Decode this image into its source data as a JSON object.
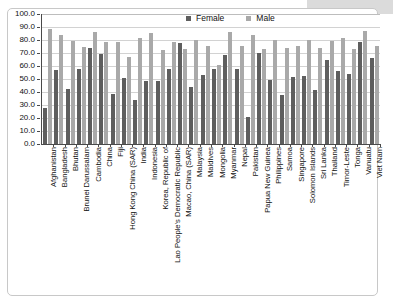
{
  "chart_data": {
    "type": "bar",
    "title": "",
    "xlabel": "",
    "ylabel": "",
    "ylim": [
      0,
      100
    ],
    "ytick_labels": [
      "100.0",
      "90.0",
      "80.0",
      "70.0",
      "60.0",
      "50.0",
      "40.0",
      "30.0",
      "20.0",
      "10.0",
      "0.0"
    ],
    "ytick_values": [
      100,
      90,
      80,
      70,
      60,
      50,
      40,
      30,
      20,
      10,
      0
    ],
    "grid": true,
    "legend_position": "top-center",
    "categories": [
      "Afghanistan",
      "Bangladesh",
      "Bhutan",
      "Brunei Darussalam",
      "Cambodia",
      "China",
      "Fiji",
      "Hong Kong China (SAR)",
      "India",
      "Indonesia",
      "Korea, Republic of",
      "Lao People's Democratic Republic",
      "Macao, China (SAR)",
      "Malaysia",
      "Maldives",
      "Mongolia",
      "Myanmar",
      "Nepal",
      "Pakistan",
      "Papua New Guinea",
      "Philippines",
      "Samoa",
      "Singapore",
      "Solomon Islands",
      "Sri Lanka",
      "Thailand",
      "Timor-Leste",
      "Tonga",
      "Vanuatu",
      "Viet Nam"
    ],
    "series": [
      {
        "name": "Female",
        "color": "#5e5e5e",
        "values": [
          28.0,
          56.8,
          42.7,
          57.5,
          74.0,
          69.2,
          38.7,
          50.5,
          33.6,
          48.6,
          48.6,
          58.0,
          77.7,
          43.6,
          53.4,
          57.5,
          68.2,
          58.0,
          20.5,
          70.0,
          49.0,
          38.0,
          51.7,
          52.7,
          41.3,
          64.5,
          56.2,
          53.6,
          78.3,
          65.8
        ]
      },
      {
        "name": "Male",
        "color": "#a9a9a9",
        "values": [
          88.3,
          83.7,
          79.2,
          74.5,
          85.8,
          78.2,
          78.3,
          67.3,
          81.2,
          85.3,
          72.3,
          78.6,
          73.3,
          79.7,
          75.5,
          61.0,
          85.8,
          75.5,
          84.2,
          72.8,
          79.7,
          73.5,
          75.2,
          79.7,
          73.8,
          79.6,
          81.5,
          72.8,
          87.2,
          75.2
        ]
      }
    ],
    "legend": [
      "Female",
      "Male"
    ]
  }
}
